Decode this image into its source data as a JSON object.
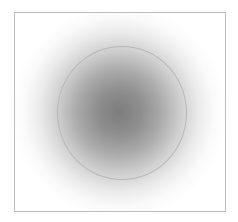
{
  "canvas": {
    "background": "#ffffff",
    "frame_border_color": "#bdbdbd",
    "blob_center_color": "#7c7c7c",
    "ring_color": "#b8b8b8"
  }
}
